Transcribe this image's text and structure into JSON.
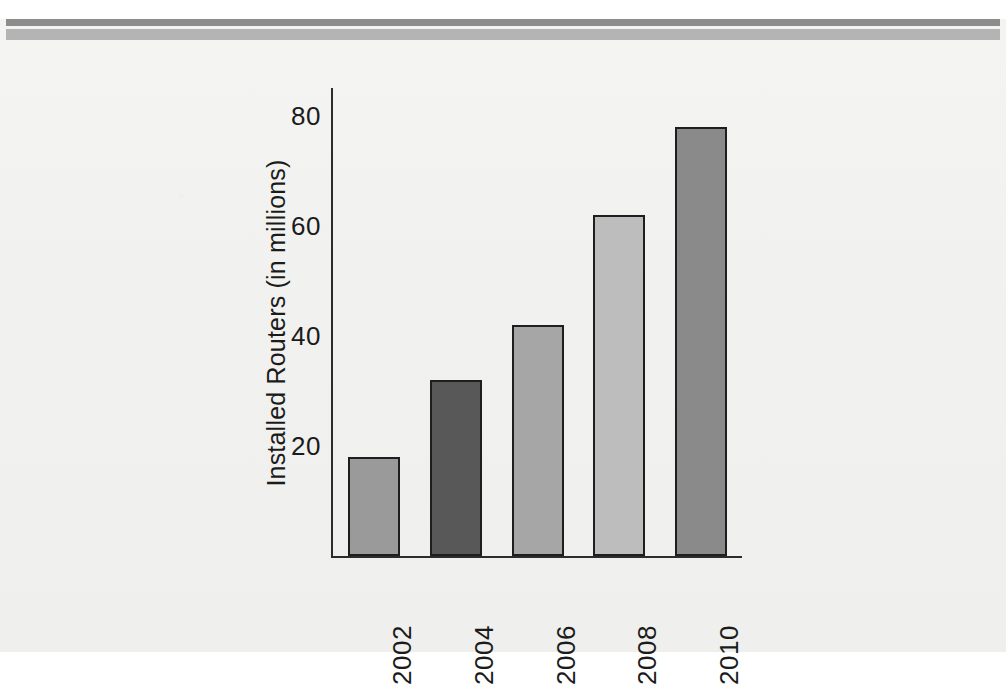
{
  "page": {
    "background_color": "#f2f2f0",
    "rules": [
      {
        "name": "upper-rule",
        "color": "#8d8d8d"
      },
      {
        "name": "lower-rule",
        "color": "#b4b4b4"
      }
    ]
  },
  "chart_data": {
    "type": "bar",
    "title": "",
    "xlabel": "",
    "ylabel": "Installed Routers (in millions)",
    "categories": [
      "2002",
      "2004",
      "2006",
      "2008",
      "2010"
    ],
    "values": [
      18,
      32,
      42,
      62,
      78
    ],
    "bar_colors": [
      "#9a9a9a",
      "#585858",
      "#a6a6a6",
      "#bdbdbd",
      "#8a8a8a"
    ],
    "bar_outline_color": "#1e1e1e",
    "ylim": [
      0,
      85
    ],
    "yticks": [
      20,
      40,
      60,
      80
    ],
    "ytick_labels": [
      "20",
      "40",
      "60",
      "80"
    ],
    "grid": false,
    "legend": false,
    "xtick_rotation": 90,
    "ylabel_rotation": 90,
    "axis_color": "#2c2c2c"
  }
}
